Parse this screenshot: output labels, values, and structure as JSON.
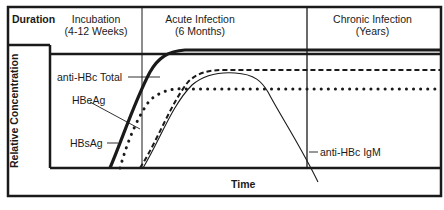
{
  "header": {
    "duration_label": "Duration",
    "phases": [
      {
        "name": "Incubation",
        "period": "(4-12 Weeks)"
      },
      {
        "name": "Acute Infection",
        "period": "(6 Months)"
      },
      {
        "name": "Chronic Infection",
        "period": "(Years)"
      }
    ]
  },
  "axes": {
    "ylabel": "Relative Concentration",
    "xlabel": "Time"
  },
  "markers": [
    {
      "label": "anti-HBc Total",
      "line_style": "dashed"
    },
    {
      "label": "HBeAg",
      "line_style": "dotted"
    },
    {
      "label": "HBsAg",
      "line_style": "thick-solid"
    },
    {
      "label": "anti-HBc IgM",
      "line_style": "thin-solid"
    }
  ],
  "colors": {
    "ink": "#1a1a1a",
    "background": "#ffffff"
  }
}
